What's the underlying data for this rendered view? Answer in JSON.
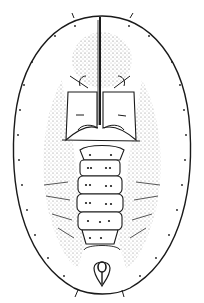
{
  "figure": {
    "background_color": "#ffffff",
    "ink_color": "#1a1a1a",
    "stipple_color": "#555555",
    "body_outline": {
      "cx": 102,
      "cy": 152,
      "rx": 86,
      "ry": 140
    },
    "segments_count": 7,
    "has_caption": false
  }
}
